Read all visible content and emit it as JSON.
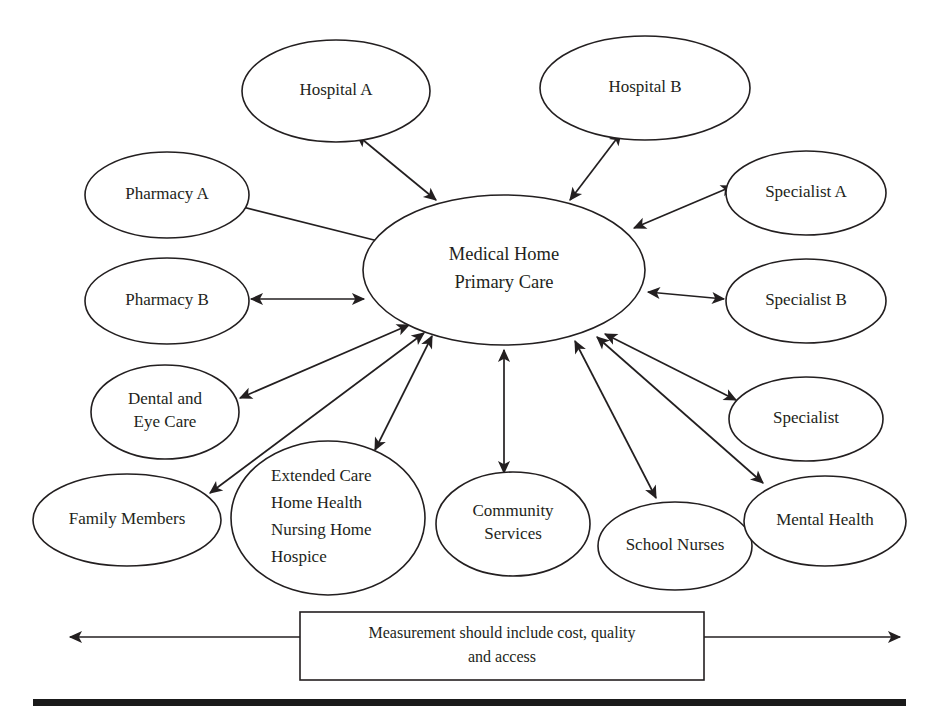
{
  "diagram": {
    "type": "hub-and-spoke-network",
    "background_color": "#ffffff",
    "stroke_color": "#231f20",
    "center": {
      "id": "medical-home",
      "lines": [
        "Medical Home",
        "Primary Care"
      ],
      "cx": 504,
      "cy": 270,
      "rx": 141,
      "ry": 75
    },
    "nodes": [
      {
        "id": "hospital-a",
        "lines": [
          "Hospital A"
        ],
        "cx": 336,
        "cy": 91,
        "rx": 94,
        "ry": 51,
        "align": "middle"
      },
      {
        "id": "hospital-b",
        "lines": [
          "Hospital B"
        ],
        "cx": 645,
        "cy": 88,
        "rx": 105,
        "ry": 52,
        "align": "middle"
      },
      {
        "id": "pharmacy-a",
        "lines": [
          "Pharmacy A"
        ],
        "cx": 167,
        "cy": 195,
        "rx": 82,
        "ry": 43,
        "align": "middle"
      },
      {
        "id": "pharmacy-b",
        "lines": [
          "Pharmacy B"
        ],
        "cx": 167,
        "cy": 301,
        "rx": 82,
        "ry": 43,
        "align": "middle"
      },
      {
        "id": "specialist-a",
        "lines": [
          "Specialist A"
        ],
        "cx": 806,
        "cy": 193,
        "rx": 80,
        "ry": 42,
        "align": "middle"
      },
      {
        "id": "specialist-b",
        "lines": [
          "Specialist B"
        ],
        "cx": 806,
        "cy": 301,
        "rx": 80,
        "ry": 42,
        "align": "middle"
      },
      {
        "id": "specialist",
        "lines": [
          "Specialist"
        ],
        "cx": 806,
        "cy": 419,
        "rx": 77,
        "ry": 42,
        "align": "middle"
      },
      {
        "id": "dental-and-eye-care",
        "lines": [
          "Dental and",
          "Eye Care"
        ],
        "cx": 165,
        "cy": 412,
        "rx": 74,
        "ry": 47,
        "align": "middle"
      },
      {
        "id": "family-members",
        "lines": [
          "Family Members"
        ],
        "cx": 127,
        "cy": 520,
        "rx": 94,
        "ry": 46,
        "align": "middle"
      },
      {
        "id": "extended-care",
        "lines": [
          "Extended Care",
          "Home Health",
          "Nursing Home",
          "Hospice"
        ],
        "cx": 328,
        "cy": 518,
        "rx": 97,
        "ry": 77,
        "align": "start"
      },
      {
        "id": "community-services",
        "lines": [
          "Community",
          "Services"
        ],
        "cx": 513,
        "cy": 524,
        "rx": 77,
        "ry": 52,
        "align": "middle"
      },
      {
        "id": "school-nurses",
        "lines": [
          "School Nurses"
        ],
        "cx": 675,
        "cy": 546,
        "rx": 77,
        "ry": 44,
        "align": "middle"
      },
      {
        "id": "mental-health",
        "lines": [
          "Mental Health"
        ],
        "cx": 825,
        "cy": 521,
        "rx": 81,
        "ry": 45,
        "align": "middle"
      }
    ],
    "edges": [
      {
        "id": "edge-hospital-a",
        "from": "medical-home",
        "to": "hospital-a",
        "arrow": "both",
        "x1": 436,
        "y1": 200,
        "x2": 357,
        "y2": 135
      },
      {
        "id": "edge-hospital-b",
        "from": "medical-home",
        "to": "hospital-b",
        "arrow": "both",
        "x1": 570,
        "y1": 200,
        "x2": 621,
        "y2": 133
      },
      {
        "id": "edge-pharmacy-a",
        "from": "medical-home",
        "to": "pharmacy-a",
        "arrow": "both",
        "x1": 390,
        "y1": 244,
        "x2": 215,
        "y2": 200
      },
      {
        "id": "edge-pharmacy-b",
        "from": "medical-home",
        "to": "pharmacy-b",
        "arrow": "both",
        "x1": 364,
        "y1": 299,
        "x2": 251,
        "y2": 299
      },
      {
        "id": "edge-specialist-a",
        "from": "medical-home",
        "to": "specialist-a",
        "arrow": "both",
        "x1": 634,
        "y1": 228,
        "x2": 733,
        "y2": 186
      },
      {
        "id": "edge-specialist-b",
        "from": "medical-home",
        "to": "specialist-b",
        "arrow": "both",
        "x1": 648,
        "y1": 292,
        "x2": 724,
        "y2": 299
      },
      {
        "id": "edge-specialist",
        "from": "medical-home",
        "to": "specialist",
        "arrow": "both",
        "x1": 605,
        "y1": 334,
        "x2": 736,
        "y2": 400
      },
      {
        "id": "edge-dental",
        "from": "medical-home",
        "to": "dental-and-eye-care",
        "arrow": "both",
        "x1": 409,
        "y1": 325,
        "x2": 240,
        "y2": 398
      },
      {
        "id": "edge-family-members",
        "from": "medical-home",
        "to": "family-members",
        "arrow": "both",
        "x1": 424,
        "y1": 333,
        "x2": 210,
        "y2": 493
      },
      {
        "id": "edge-extended-care",
        "from": "medical-home",
        "to": "extended-care",
        "arrow": "both",
        "x1": 432,
        "y1": 336,
        "x2": 375,
        "y2": 450
      },
      {
        "id": "edge-community-services",
        "from": "medical-home",
        "to": "community-services",
        "arrow": "both",
        "x1": 504,
        "y1": 350,
        "x2": 504,
        "y2": 473
      },
      {
        "id": "edge-school-nurses",
        "from": "medical-home",
        "to": "school-nurses",
        "arrow": "both",
        "x1": 575,
        "y1": 341,
        "x2": 656,
        "y2": 498
      },
      {
        "id": "edge-mental-health",
        "from": "medical-home",
        "to": "mental-health",
        "arrow": "both",
        "x1": 597,
        "y1": 337,
        "x2": 763,
        "y2": 483
      }
    ],
    "measurement": {
      "id": "measurement-box",
      "lines": [
        "Measurement should include cost, quality",
        "and access"
      ],
      "x": 300,
      "y": 612,
      "width": 404,
      "height": 68,
      "arrow_y": 637,
      "left_arrow_x": 70,
      "right_arrow_x": 900
    },
    "bottom_rule": {
      "id": "bottom-rule",
      "x": 33,
      "y": 699,
      "width": 873,
      "height": 7
    }
  }
}
